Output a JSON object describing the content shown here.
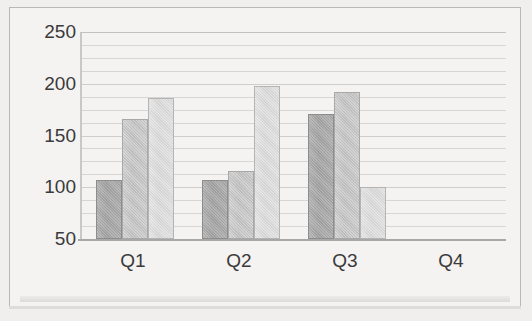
{
  "chart_data": {
    "type": "bar",
    "title": "",
    "xlabel": "",
    "ylabel": "",
    "categories": [
      "Q1",
      "Q2",
      "Q3",
      "Q4"
    ],
    "series": [
      {
        "name": "Series 1",
        "color": "#a0a0a0",
        "values": [
          107,
          107,
          171,
          null
        ]
      },
      {
        "name": "Series 2",
        "color": "#c0c0c0",
        "values": [
          166,
          116,
          192,
          null
        ]
      },
      {
        "name": "Series 3",
        "color": "#d8d8d8",
        "values": [
          186,
          198,
          100,
          null
        ]
      }
    ],
    "ylim": [
      50,
      250
    ],
    "ytick_labels": [
      "250",
      "200",
      "150",
      "100",
      "50"
    ],
    "ytick_values": [
      250,
      200,
      150,
      100,
      50
    ],
    "gridline_values": [
      250,
      237.5,
      225,
      212.5,
      200,
      187.5,
      175,
      162.5,
      150,
      137.5,
      125,
      112.5,
      100,
      87.5,
      75,
      62.5,
      50
    ],
    "major_gridline_values": [
      250,
      200,
      150,
      100,
      50
    ],
    "grid": true,
    "legend": "none",
    "legend_position": "none",
    "background_color": "#f4f3f2",
    "axis_color": "#a8a7a5",
    "gridline_color": "#d7d6d4"
  }
}
